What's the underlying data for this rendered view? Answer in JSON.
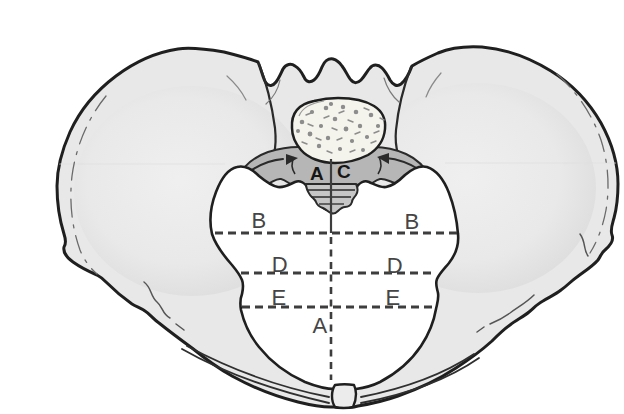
{
  "figure": {
    "type": "anatomical line illustration",
    "background": "#ffffff",
    "colors": {
      "bone": "#e8e8e8",
      "bone_outline": "#1f1f1f",
      "sacral_ala": "#b6b6b6",
      "sacrum_apex": "#c6c6c6",
      "sacral_body": "#f4f3ec",
      "speckle": "#8d8d8d",
      "inlet": "#ffffff",
      "symphysis": "#ececec",
      "line": "#3d3d3d",
      "label": "#454545"
    }
  },
  "labels": {
    "a_top": "A",
    "c_top": "C",
    "b_left": "B",
    "b_right": "B",
    "d_left": "D",
    "d_right": "D",
    "e_left": "E",
    "e_right": "E",
    "a_bottom": "A"
  },
  "lines": {
    "b": {
      "style": "dashed",
      "orientation": "horizontal"
    },
    "d": {
      "style": "dashed",
      "orientation": "horizontal"
    },
    "e": {
      "style": "dashed",
      "orientation": "horizontal"
    },
    "midline_upper": {
      "style": "solid",
      "orientation": "vertical"
    },
    "midline_lower": {
      "style": "dashed",
      "orientation": "vertical"
    }
  }
}
